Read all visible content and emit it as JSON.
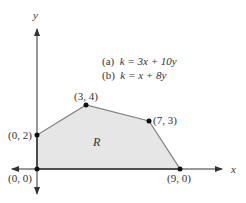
{
  "axes": {
    "x_label": "x",
    "y_label": "y"
  },
  "equations": [
    {
      "tag": "(a)",
      "text": "k = 3x + 10y"
    },
    {
      "tag": "(b)",
      "text": "k = x + 8y"
    }
  ],
  "region_label": "R",
  "vertices": [
    {
      "label": "(0, 0)",
      "x": 0,
      "y": 0
    },
    {
      "label": "(0, 2)",
      "x": 0,
      "y": 2
    },
    {
      "label": "(3, 4)",
      "x": 3,
      "y": 4
    },
    {
      "label": "(7, 3)",
      "x": 7,
      "y": 3
    },
    {
      "label": "(9, 0)",
      "x": 9,
      "y": 0
    }
  ],
  "colors": {
    "region_fill": "#e6e6e6",
    "edge": "#777777",
    "axis": "#333333",
    "point": "#111111"
  }
}
